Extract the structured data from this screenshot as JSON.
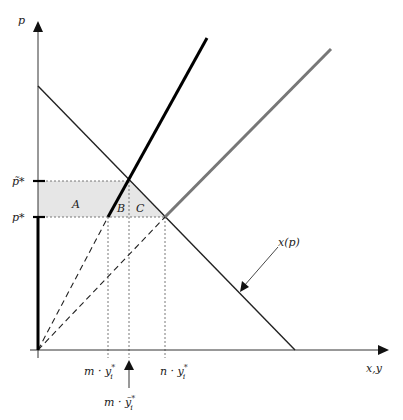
{
  "diagram": {
    "axes": {
      "y_label": "p",
      "x_label": "x,y"
    },
    "price_levels": {
      "p_tilde_star": "p̃*",
      "p_star": "p*"
    },
    "areas": {
      "A": "A",
      "B": "B",
      "C": "C"
    },
    "quantities": {
      "m_y_star": "m · y",
      "m_y_star_sub": "i",
      "n_y_star": "n · y",
      "n_y_star_sub": "i",
      "m_y_tilde_star": "m · ỹ",
      "m_y_tilde_star_sub": "i",
      "star": "*"
    },
    "curves": {
      "demand_label": "x(p)"
    },
    "colors": {
      "axis": "#333333",
      "demand": "#222222",
      "supply_m": "#000000",
      "supply_n": "#777777",
      "shaded": "#e6e6e6",
      "dashed": "#555555"
    }
  }
}
